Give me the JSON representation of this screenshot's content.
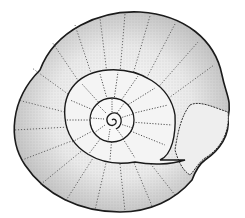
{
  "image": {
    "subject": "ammonite fossil illustration",
    "style": "stipple pen-and-ink",
    "background_color": "#ffffff",
    "ink_color": "#1a1a1a",
    "shading_color": "#8a8a8a",
    "width": 245,
    "height": 218
  }
}
